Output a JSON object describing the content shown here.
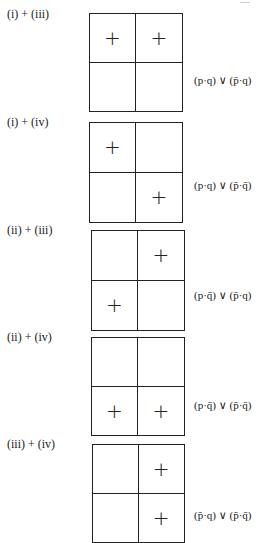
{
  "figure": {
    "type": "truth-table-diagrams",
    "diagrams": [
      {
        "label": "(i) + (iii)",
        "cells": [
          "+",
          "+",
          "",
          ""
        ],
        "formula": "(p·q) ∨ (p̄·q)",
        "formula_parts": {
          "left": "p·q",
          "right": "p̄·q"
        }
      },
      {
        "label": "(i) + (iv)",
        "cells": [
          "+",
          "",
          "",
          "+"
        ],
        "formula": "(p·q) ∨ (p̄·q̄)",
        "formula_parts": {
          "left": "p·q",
          "right": "p̄·q̄"
        }
      },
      {
        "label": "(ii) + (iii)",
        "cells": [
          "",
          "+",
          "+",
          ""
        ],
        "formula": "(p·q̄) ∨ (p̄·q)",
        "formula_parts": {
          "left": "p·q̄",
          "right": "p̄·q"
        }
      },
      {
        "label": "(ii) + (iv)",
        "cells": [
          "",
          "",
          "+",
          "+"
        ],
        "formula": "(p·q̄) ∨ (p̄·q̄)",
        "formula_parts": {
          "left": "p·q̄",
          "right": "p̄·q̄"
        }
      },
      {
        "label": "(iii) + (iv)",
        "cells": [
          "",
          "+",
          "",
          "+"
        ],
        "formula": "(p̄·q) ∨ (p̄·q̄)",
        "formula_parts": {
          "left": "p̄·q",
          "right": "p̄·q̄"
        }
      }
    ]
  }
}
